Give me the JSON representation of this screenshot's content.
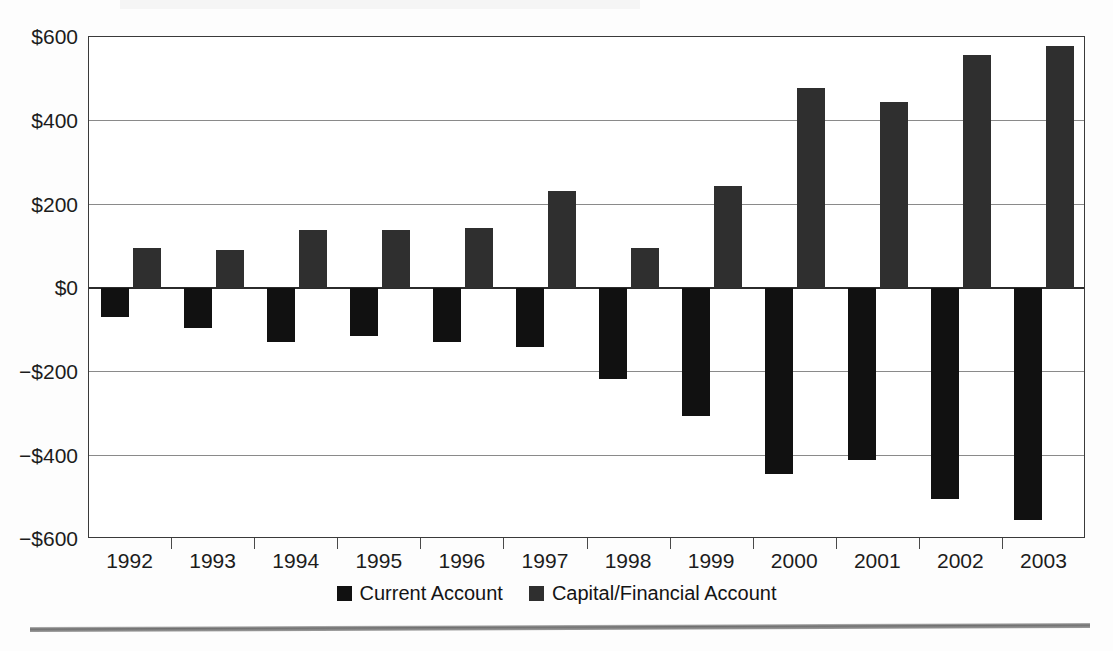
{
  "chart_data": {
    "type": "bar",
    "title": "",
    "subtitle": "",
    "xlabel": "",
    "ylabel": "",
    "categories": [
      "1992",
      "1993",
      "1994",
      "1995",
      "1996",
      "1997",
      "1998",
      "1999",
      "2000",
      "2001",
      "2002",
      "2003"
    ],
    "series": [
      {
        "name": "Current Account",
        "color": "#111111",
        "values": [
          -70,
          -95,
          -130,
          -115,
          -128,
          -140,
          -218,
          -305,
          -445,
          -410,
          -505,
          -555
        ]
      },
      {
        "name": "Capital/Financial Account",
        "color": "#2f2f2f",
        "values": [
          96,
          92,
          138,
          138,
          143,
          233,
          95,
          245,
          478,
          445,
          557,
          578
        ]
      }
    ],
    "ylim": [
      -600,
      600
    ],
    "yticks": [
      600,
      400,
      200,
      0,
      -200,
      -400,
      -600
    ],
    "ytick_labels": [
      "$600",
      "$400",
      "$200",
      "$0",
      "−$200",
      "−$400",
      "−$600"
    ],
    "grid": true,
    "grid_axis": "y",
    "legend_position": "bottom",
    "units": "billions of U.S. dollars"
  },
  "legend": {
    "entries": [
      {
        "label": "Current Account",
        "color": "#111111",
        "swatch": "legend-swatch-current"
      },
      {
        "label": "Capital/Financial Account",
        "color": "#2f2f2f",
        "swatch": "legend-swatch-capital"
      }
    ]
  }
}
